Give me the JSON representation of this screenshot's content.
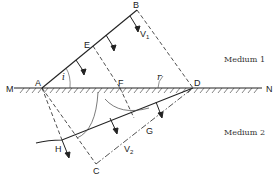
{
  "diagram": {
    "media": [
      {
        "label": "Medium 1",
        "x": 228,
        "y": 62
      },
      {
        "label": "Medium 2",
        "x": 228,
        "y": 135
      }
    ],
    "points": {
      "M": {
        "label": "M",
        "x": 6,
        "y": 92
      },
      "N": {
        "label": "N",
        "x": 268,
        "y": 92
      },
      "A": {
        "label": "A",
        "x": 36,
        "y": 86
      },
      "B": {
        "label": "B",
        "x": 134,
        "y": 8
      },
      "C": {
        "label": "C",
        "x": 92,
        "y": 172
      },
      "D": {
        "label": "D",
        "x": 195,
        "y": 86
      },
      "E": {
        "label": "E",
        "x": 85,
        "y": 48
      },
      "F": {
        "label": "F",
        "x": 111,
        "y": 86
      },
      "G": {
        "label": "G",
        "x": 148,
        "y": 133
      },
      "H": {
        "label": "H",
        "x": 56,
        "y": 151
      }
    },
    "angles": {
      "incidence": {
        "label": "i",
        "x": 60,
        "y": 80
      },
      "refraction": {
        "label": "r",
        "x": 158,
        "y": 80
      }
    },
    "velocities": {
      "v1": {
        "label": "V",
        "sub": "1",
        "x": 141,
        "y": 37
      },
      "v2": {
        "label": "V",
        "sub": "2",
        "x": 122,
        "y": 153
      }
    },
    "colors": {
      "line": "#222222",
      "background": "#ffffff"
    }
  }
}
